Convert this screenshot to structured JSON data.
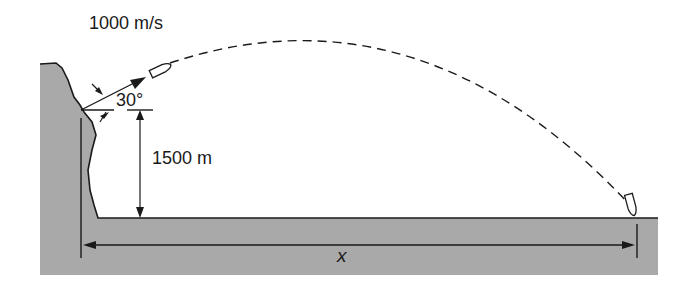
{
  "diagram": {
    "type": "projectile-motion",
    "labels": {
      "speed": "1000 m/s",
      "angle": "30°",
      "height": "1500 m",
      "range": "x"
    },
    "colors": {
      "ground": "#a9a9a9",
      "line": "#1a1a1a",
      "background": "#ffffff"
    }
  }
}
